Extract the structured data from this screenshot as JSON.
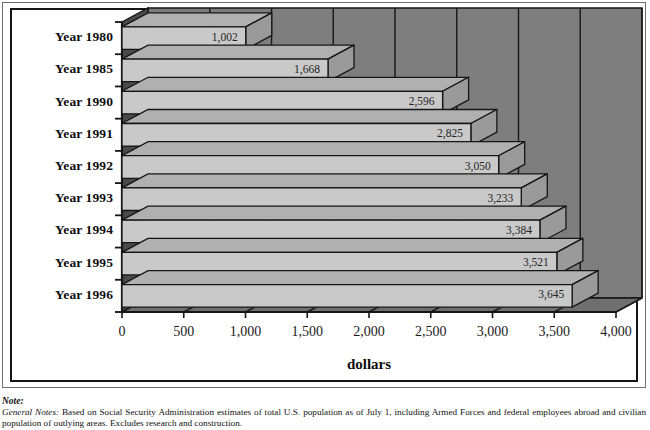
{
  "chart_data": {
    "type": "bar",
    "orientation": "horizontal",
    "title": "",
    "xlabel": "dollars",
    "ylabel": "",
    "xlim": [
      0,
      4000
    ],
    "grid": true,
    "legend": false,
    "style_3d": true,
    "categories": [
      "Year 1980",
      "Year 1985",
      "Year 1990",
      "Year 1991",
      "Year 1992",
      "Year 1993",
      "Year 1994",
      "Year 1995",
      "Year 1996"
    ],
    "values": [
      1002,
      1668,
      2596,
      2825,
      3050,
      3233,
      3384,
      3521,
      3645
    ],
    "value_labels": [
      "1,002",
      "1,668",
      "2,596",
      "2,825",
      "3,050",
      "3,233",
      "3,384",
      "3,521",
      "3,645"
    ],
    "xticks": [
      0,
      500,
      1000,
      1500,
      2000,
      2500,
      3000,
      3500,
      4000
    ],
    "xtick_labels": [
      "0",
      "500",
      "1,000",
      "1,500",
      "2,000",
      "2,500",
      "3,000",
      "3,500",
      "4,000"
    ],
    "colors": {
      "bar_face": "#c9c9c9",
      "bar_top": "#b0b0b0",
      "bar_side": "#9a9a9a",
      "wall_back": "#7e7e7e",
      "wall_floor": "#6f6f6f",
      "wall_left": "#4a4a4a",
      "gridline": "#1c1c1c",
      "outline": "#151515",
      "text": "#111111",
      "page": "#ffffff"
    }
  },
  "note": {
    "heading": "Note:",
    "label": "General Notes:",
    "body": "Based on Social Security Administration estimates of total U.S. population as of July 1, including Armed Forces and federal employees abroad and civilian population of outlying areas. Excludes research and construction."
  }
}
